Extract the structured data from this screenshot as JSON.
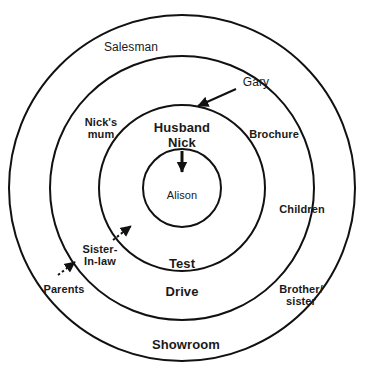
{
  "diagram": {
    "type": "concentric-circles",
    "title": "",
    "background_color": "#ffffff",
    "stroke_color": "#111111",
    "text_color": "#1a1a1a",
    "center": {
      "x": 182,
      "y": 188
    },
    "rings": [
      {
        "name": "outer-ring",
        "radius": 173,
        "label": "Showroom"
      },
      {
        "name": "second-ring",
        "radius": 132,
        "label": "Drive"
      },
      {
        "name": "third-ring",
        "radius": 83,
        "label": "Test"
      },
      {
        "name": "inner-circle",
        "radius": 39,
        "label": "Alison"
      }
    ],
    "labels": {
      "salesman": "Salesman",
      "gary": "Gary",
      "nicks_mum": "Nick's\nmum",
      "brochure": "Brochure",
      "husband_nick": "Husband\nNick",
      "alison": "Alison",
      "children": "Children",
      "test": "Test",
      "drive": "Drive",
      "sister_in_law": "Sister-\nIn-law",
      "parents": "Parents",
      "brother_sister": "Brother/\nsister",
      "showroom": "Showroom"
    },
    "arrows": [
      {
        "name": "gary-arrow",
        "from": "Gary",
        "to": "Husband Nick ring",
        "style": "solid"
      },
      {
        "name": "nick-to-alison-arrow",
        "from": "Husband Nick",
        "to": "Alison",
        "style": "solid"
      },
      {
        "name": "sister-in-law-arrow",
        "from": "Sister-In-law",
        "to": "Test ring",
        "style": "dotted"
      },
      {
        "name": "parents-arrow",
        "from": "Parents",
        "to": "Drive ring",
        "style": "dotted"
      }
    ]
  }
}
